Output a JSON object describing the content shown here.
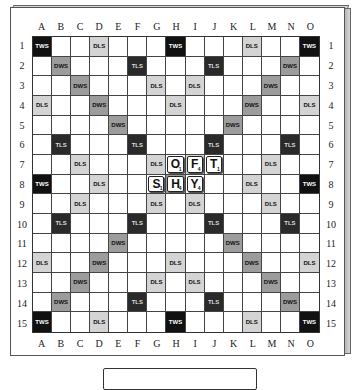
{
  "board": {
    "columns": [
      "A",
      "B",
      "C",
      "D",
      "E",
      "F",
      "G",
      "H",
      "I",
      "J",
      "K",
      "L",
      "M",
      "N",
      "O"
    ],
    "rows": [
      "1",
      "2",
      "3",
      "4",
      "5",
      "6",
      "7",
      "8",
      "9",
      "10",
      "11",
      "12",
      "13",
      "14",
      "15"
    ],
    "premium_squares": [
      [
        "TWS",
        "",
        "",
        "DLS",
        "",
        "",
        "",
        "TWS",
        "",
        "",
        "",
        "DLS",
        "",
        "",
        "TWS"
      ],
      [
        "",
        "DWS",
        "",
        "",
        "",
        "TLS",
        "",
        "",
        "",
        "TLS",
        "",
        "",
        "",
        "DWS",
        ""
      ],
      [
        "",
        "",
        "DWS",
        "",
        "",
        "",
        "DLS",
        "",
        "DLS",
        "",
        "",
        "",
        "DWS",
        "",
        ""
      ],
      [
        "DLS",
        "",
        "",
        "DWS",
        "",
        "",
        "",
        "DLS",
        "",
        "",
        "",
        "DWS",
        "",
        "",
        "DLS"
      ],
      [
        "",
        "",
        "",
        "",
        "DWS",
        "",
        "",
        "",
        "",
        "",
        "DWS",
        "",
        "",
        "",
        ""
      ],
      [
        "",
        "TLS",
        "",
        "",
        "",
        "TLS",
        "",
        "",
        "",
        "TLS",
        "",
        "",
        "",
        "TLS",
        ""
      ],
      [
        "",
        "",
        "DLS",
        "",
        "",
        "",
        "DLS",
        "",
        "DLS",
        "",
        "",
        "",
        "DLS",
        "",
        ""
      ],
      [
        "TWS",
        "",
        "",
        "DLS",
        "",
        "",
        "",
        "DWS",
        "",
        "",
        "",
        "DLS",
        "",
        "",
        "TWS"
      ],
      [
        "",
        "",
        "DLS",
        "",
        "",
        "",
        "DLS",
        "",
        "DLS",
        "",
        "",
        "",
        "DLS",
        "",
        ""
      ],
      [
        "",
        "TLS",
        "",
        "",
        "",
        "TLS",
        "",
        "",
        "",
        "TLS",
        "",
        "",
        "",
        "TLS",
        ""
      ],
      [
        "",
        "",
        "",
        "",
        "DWS",
        "",
        "",
        "",
        "",
        "",
        "DWS",
        "",
        "",
        "",
        ""
      ],
      [
        "DLS",
        "",
        "",
        "DWS",
        "",
        "",
        "",
        "DLS",
        "",
        "",
        "",
        "DWS",
        "",
        "",
        "DLS"
      ],
      [
        "",
        "",
        "DWS",
        "",
        "",
        "",
        "DLS",
        "",
        "DLS",
        "",
        "",
        "",
        "DWS",
        "",
        ""
      ],
      [
        "",
        "DWS",
        "",
        "",
        "",
        "TLS",
        "",
        "",
        "",
        "TLS",
        "",
        "",
        "",
        "DWS",
        ""
      ],
      [
        "TWS",
        "",
        "",
        "DLS",
        "",
        "",
        "",
        "TWS",
        "",
        "",
        "",
        "DLS",
        "",
        "",
        "TWS"
      ]
    ],
    "hidden_labels": {
      "7,7": true
    },
    "tiles": [
      {
        "row": 7,
        "col": "H",
        "letter": "O",
        "points": "1"
      },
      {
        "row": 7,
        "col": "I",
        "letter": "F",
        "points": "4"
      },
      {
        "row": 7,
        "col": "J",
        "letter": "T",
        "points": "1"
      },
      {
        "row": 8,
        "col": "G",
        "letter": "S",
        "points": "1"
      },
      {
        "row": 8,
        "col": "H",
        "letter": "H",
        "points": "4"
      },
      {
        "row": 8,
        "col": "I",
        "letter": "Y",
        "points": "4"
      }
    ],
    "colors": {
      "TWS": "#111111",
      "TLS": "#2a2a2a",
      "DWS": "#9c9c9c",
      "DLS": "#d4d4d4"
    }
  },
  "rack": {
    "tiles": []
  }
}
